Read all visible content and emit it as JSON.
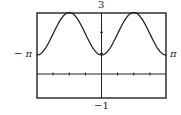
{
  "chart_data": {
    "type": "line",
    "title": "",
    "xlabel": "",
    "ylabel": "",
    "xlim": [
      -3.14159,
      3.14159
    ],
    "ylim": [
      -1,
      3
    ],
    "x_tick_step": 0.785398,
    "y_tick_step": 1,
    "grid": false,
    "legend": null,
    "window_labels": {
      "ymax": "3",
      "ymin": "−1",
      "xmin": "− π",
      "xmax": "π"
    },
    "series": [
      {
        "name": "f(x)",
        "description": "periodic curve, minima 1 at x = -π, 0, π; maxima 3 at x = ±π/2",
        "x": [
          -3.1416,
          -2.7489,
          -2.3562,
          -1.9635,
          -1.5708,
          -1.1781,
          -0.7854,
          -0.3927,
          0,
          0.3927,
          0.7854,
          1.1781,
          1.5708,
          1.9635,
          2.3562,
          2.7489,
          3.1416
        ],
        "y": [
          1.0,
          1.29,
          2.0,
          2.71,
          3.0,
          2.71,
          2.0,
          1.29,
          1.0,
          1.29,
          2.0,
          2.71,
          3.0,
          2.71,
          2.0,
          1.29,
          1.0
        ]
      }
    ]
  },
  "colors": {
    "line": "#222222",
    "frame": "#222222",
    "background": "#ffffff"
  }
}
